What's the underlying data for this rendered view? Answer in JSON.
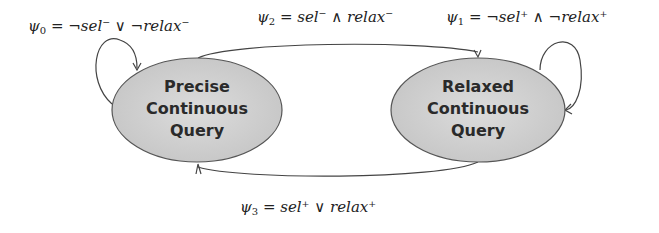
{
  "diagram": {
    "type": "state-transition",
    "nodes": [
      {
        "id": "precise",
        "lines": [
          "Precise",
          "Continuous",
          "Query"
        ]
      },
      {
        "id": "relaxed",
        "lines": [
          "Relaxed",
          "Continuous",
          "Query"
        ]
      }
    ],
    "edges": [
      {
        "from": "precise",
        "to": "precise",
        "label_sym": "ψ",
        "label_sub": "0",
        "label_expr": " = ¬sel⁻ ∨ ¬relax⁻"
      },
      {
        "from": "relaxed",
        "to": "relaxed",
        "label_sym": "ψ",
        "label_sub": "1",
        "label_expr": " = ¬sel⁺ ∧ ¬relax⁺"
      },
      {
        "from": "precise",
        "to": "relaxed",
        "label_sym": "ψ",
        "label_sub": "2",
        "label_expr": " = sel⁻ ∧ relax⁻"
      },
      {
        "from": "relaxed",
        "to": "precise",
        "label_sym": "ψ",
        "label_sub": "3",
        "label_expr": " = sel⁺ ∨ relax⁺"
      }
    ],
    "colors": {
      "node_fill": "#cfcfcf",
      "node_stroke": "#555555",
      "edge": "#444444"
    }
  }
}
